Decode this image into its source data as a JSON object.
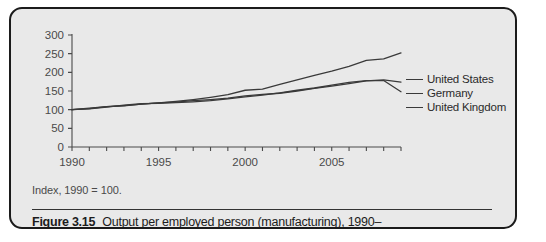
{
  "figure": {
    "number_label": "Figure 3.15",
    "caption_text": "Output per employed person (manufacturing), 1990–",
    "index_note": "Index, 1990 = 100."
  },
  "legend": {
    "items": [
      {
        "label": "United States",
        "color": "#3a3a3a"
      },
      {
        "label": "Germany",
        "color": "#3a3a3a"
      },
      {
        "label": "United Kingdom",
        "color": "#3a3a3a"
      }
    ]
  },
  "chart_data": {
    "type": "line",
    "title": "Output per employed person (manufacturing), 1990–",
    "subtitle": "Index, 1990 = 100.",
    "xlabel": "",
    "ylabel": "",
    "xlim": [
      1990,
      2009
    ],
    "ylim": [
      0,
      300
    ],
    "yticks": [
      0,
      50,
      100,
      150,
      200,
      250,
      300
    ],
    "ytick_labels": [
      "0",
      "50",
      "100",
      "150",
      "200",
      "250",
      "300"
    ],
    "xticks": [
      1990,
      1995,
      2000,
      2005
    ],
    "xtick_labels": [
      "1990",
      "1995",
      "2000",
      "2005"
    ],
    "xticks_minor_step": 1,
    "grid": false,
    "legend_position": "right",
    "x": [
      1990,
      1991,
      1992,
      1993,
      1994,
      1995,
      1996,
      1997,
      1998,
      1999,
      2000,
      2001,
      2002,
      2003,
      2004,
      2005,
      2006,
      2007,
      2008,
      2009
    ],
    "series": [
      {
        "name": "United States",
        "values": [
          100,
          103,
          108,
          111,
          115,
          118,
          122,
          127,
          133,
          140,
          152,
          155,
          168,
          180,
          192,
          203,
          216,
          232,
          236,
          252
        ]
      },
      {
        "name": "Germany",
        "values": [
          100,
          104,
          108,
          110,
          115,
          118,
          120,
          124,
          127,
          131,
          137,
          141,
          144,
          150,
          157,
          163,
          170,
          177,
          180,
          174
        ]
      },
      {
        "name": "United Kingdom",
        "values": [
          100,
          102,
          107,
          112,
          116,
          117,
          119,
          121,
          124,
          129,
          134,
          139,
          145,
          152,
          158,
          166,
          173,
          178,
          178,
          148
        ]
      }
    ]
  }
}
